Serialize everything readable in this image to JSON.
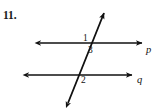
{
  "problem": {
    "number": "11."
  },
  "figure": {
    "stroke_color": "#111111",
    "background_color": "#ffffff",
    "angle_labels": [
      {
        "id": "1",
        "text": "1",
        "x": 86,
        "y": 38,
        "position": "above-left of upper intersection"
      },
      {
        "id": "3",
        "text": "3",
        "x": 91,
        "y": 50,
        "position": "below-right of upper intersection"
      },
      {
        "id": "2",
        "text": "2",
        "x": 84,
        "y": 80,
        "position": "below-right of lower intersection"
      }
    ],
    "line_labels": [
      {
        "id": "p",
        "text": "p",
        "x": 149,
        "y": 49,
        "line": "upper horizontal line"
      },
      {
        "id": "q",
        "text": "q",
        "x": 140,
        "y": 79,
        "line": "lower horizontal line"
      }
    ],
    "lines": [
      {
        "name": "line-p",
        "type": "horizontal",
        "x1": 40,
        "y1": 43,
        "x2": 142,
        "y2": 43,
        "arrows": "both"
      },
      {
        "name": "line-q",
        "type": "horizontal",
        "x1": 28,
        "y1": 75,
        "x2": 132,
        "y2": 75,
        "arrows": "both"
      },
      {
        "name": "transversal",
        "type": "oblique",
        "x1": 68,
        "y1": 103,
        "x2": 104,
        "y2": 13,
        "arrows": "both"
      }
    ],
    "intersections": [
      {
        "name": "upper",
        "x": 91,
        "y": 43
      },
      {
        "name": "lower",
        "x": 78,
        "y": 75
      }
    ]
  }
}
